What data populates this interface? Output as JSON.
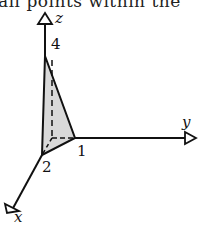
{
  "header_fragment": "all points within the",
  "diagram": {
    "axes": {
      "x_label": "x",
      "y_label": "y",
      "z_label": "z"
    },
    "vertices": {
      "v1": "1",
      "v2": "2",
      "v4": "4"
    },
    "colors": {
      "line": "#111111",
      "fill": "#d9d9d9"
    }
  }
}
